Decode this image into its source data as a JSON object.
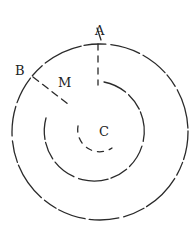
{
  "diagram": {
    "type": "concentric-circles",
    "labels": {
      "A": "A",
      "B": "B",
      "M": "M",
      "C": "C"
    },
    "center": {
      "x": 100,
      "y": 132
    },
    "circles": [
      {
        "name": "outer",
        "radius": 88
      },
      {
        "name": "middle",
        "radius": 58
      },
      {
        "name": "inner",
        "radius": 22
      }
    ],
    "stroke_color": "#2a2a2a"
  }
}
